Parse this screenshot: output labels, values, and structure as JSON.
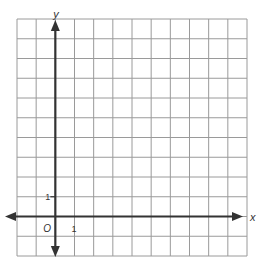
{
  "graph": {
    "grid": {
      "columns": 12,
      "rows": 12,
      "left": 17,
      "top": 19,
      "right": 247,
      "bottom": 256,
      "line_color": "#9a9a9a"
    },
    "axes": {
      "color": "#333333",
      "x_axis_row": 10,
      "y_axis_col": 2,
      "x_label": "x",
      "y_label": "y",
      "origin_label": "O",
      "x_tick_label": "1",
      "y_tick_label": "1"
    }
  }
}
